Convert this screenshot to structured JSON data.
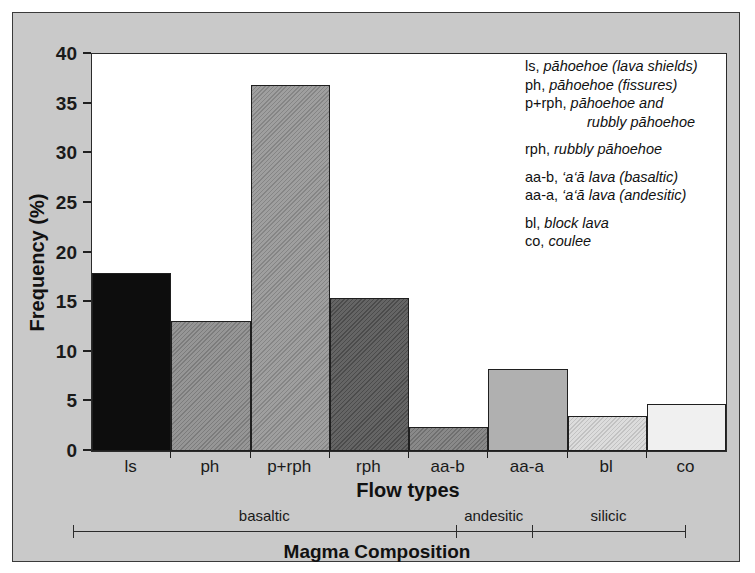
{
  "chart_data": {
    "type": "bar",
    "title": "",
    "xlabel": "Flow types",
    "ylabel": "Frequency (%)",
    "categories": [
      "ls",
      "ph",
      "p+rph",
      "rph",
      "aa-b",
      "aa-a",
      "bl",
      "co"
    ],
    "values": [
      17.9,
      13.1,
      36.9,
      15.4,
      2.4,
      8.3,
      3.5,
      4.7
    ],
    "ylim": [
      0,
      40
    ],
    "yticks": [
      0,
      5,
      10,
      15,
      20,
      25,
      30,
      35,
      40
    ],
    "ytick_labels": [
      "0",
      "5",
      "10",
      "15",
      "20",
      "25",
      "30",
      "35",
      "40"
    ],
    "grid": false,
    "legend_position": "top-right",
    "bar_colors": [
      "#0d0d0d",
      "#8a8a8a",
      "#949494",
      "#545454",
      "#7c7c7c",
      "#b0b0b0",
      "#d8d8d8",
      "#f0f0f0"
    ],
    "bar_hatched": [
      false,
      true,
      true,
      true,
      true,
      false,
      true,
      false
    ],
    "annotations": {
      "secondary_axis_label": "Magma Composition",
      "segments": [
        {
          "label": "basaltic",
          "from": "ls",
          "to": "aa-b"
        },
        {
          "label": "andesitic",
          "from": "aa-a",
          "to": "aa-a"
        },
        {
          "label": "silicic",
          "from": "bl",
          "to": "co"
        }
      ]
    }
  },
  "axes": {
    "y_title": "Frequency (%)",
    "x_title": "Flow types",
    "y_ticks": [
      "0",
      "5",
      "10",
      "15",
      "20",
      "25",
      "30",
      "35",
      "40"
    ]
  },
  "legend": {
    "entries": [
      {
        "code": "ls,",
        "desc": "pāhoehoe (lava shields)",
        "cont": "",
        "gap": false
      },
      {
        "code": "ph,",
        "desc": "pāhoehoe (fissures)",
        "cont": "",
        "gap": false
      },
      {
        "code": "p+rph,",
        "desc": "pāhoehoe and",
        "cont": "rubbly pāhoehoe",
        "gap": false
      },
      {
        "code": "rph,",
        "desc": "rubbly pāhoehoe",
        "cont": "",
        "gap": true
      },
      {
        "code": "aa-b,",
        "desc": "‘a‘ā lava (basaltic)",
        "cont": "",
        "gap": true
      },
      {
        "code": "aa-a,",
        "desc": "‘a‘ā lava (andesitic)",
        "cont": "",
        "gap": false
      },
      {
        "code": "bl,",
        "desc": "block lava",
        "cont": "",
        "gap": true
      },
      {
        "code": "co,",
        "desc": "coulee",
        "cont": "",
        "gap": false
      }
    ]
  },
  "magma": {
    "title": "Magma Composition",
    "segments": [
      "basaltic",
      "andesitic",
      "silicic"
    ]
  },
  "colors": {
    "panel_background": "#c9c9c9",
    "plot_background": "#ffffff",
    "axis": "#2b2b2b",
    "text": "#111111"
  }
}
